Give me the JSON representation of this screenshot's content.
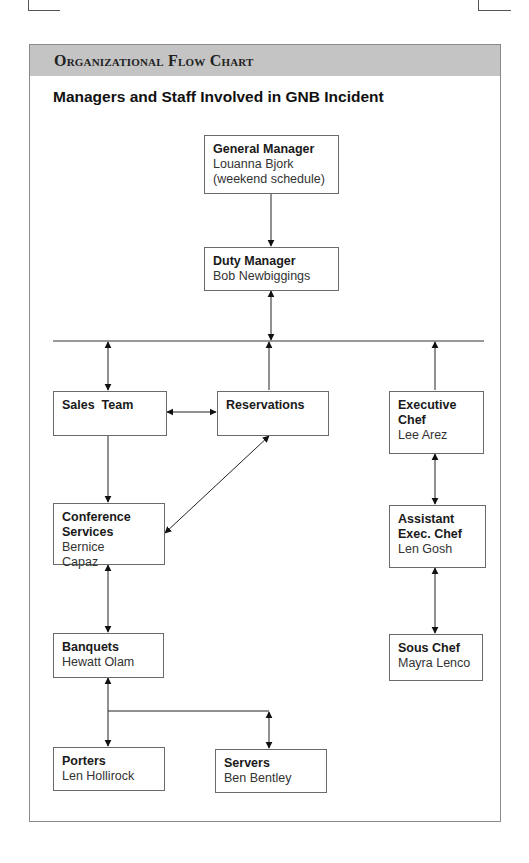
{
  "header": {
    "title": "Organizational Flow Chart",
    "subtitle": "Managers and Staff Involved in GNB Incident"
  },
  "nodes": [
    {
      "id": "general-manager",
      "role": "General Manager",
      "person": "Louanna Bjork",
      "note": "(weekend schedule)"
    },
    {
      "id": "duty-manager",
      "role": "Duty Manager",
      "person": "Bob Newbiggings"
    },
    {
      "id": "sales-team",
      "role": "Sales  Team",
      "person": ""
    },
    {
      "id": "reservations",
      "role": "Reservations",
      "person": ""
    },
    {
      "id": "executive-chef",
      "role": "Executive Chef",
      "person": "Lee Arez"
    },
    {
      "id": "conference-services",
      "role": "Conference Services",
      "person": "Bernice Capaz"
    },
    {
      "id": "assistant-exec-chef",
      "role": "Assistant Exec. Chef",
      "person": "Len Gosh"
    },
    {
      "id": "banquets",
      "role": "Banquets",
      "person": "Hewatt Olam"
    },
    {
      "id": "sous-chef",
      "role": "Sous Chef",
      "person": "Mayra Lenco"
    },
    {
      "id": "porters",
      "role": "Porters",
      "person": "Len Hollirock"
    },
    {
      "id": "servers",
      "role": "Servers",
      "person": "Ben Bentley"
    }
  ],
  "edges": [
    {
      "from": "General Manager",
      "to": "Duty Manager",
      "type": "one-way"
    },
    {
      "from": "Duty Manager",
      "to": "Horizontal bus",
      "type": "two-way"
    },
    {
      "from": "Horizontal bus",
      "to": "Sales Team",
      "type": "two-way"
    },
    {
      "from": "Reservations",
      "to": "Horizontal bus",
      "type": "one-way"
    },
    {
      "from": "Executive Chef",
      "to": "Horizontal bus",
      "type": "one-way"
    },
    {
      "from": "Sales Team",
      "to": "Reservations",
      "type": "two-way"
    },
    {
      "from": "Sales Team",
      "to": "Conference Services",
      "type": "one-way"
    },
    {
      "from": "Reservations",
      "to": "Conference Services",
      "type": "two-way"
    },
    {
      "from": "Executive Chef",
      "to": "Assistant Exec. Chef",
      "type": "two-way"
    },
    {
      "from": "Conference Services",
      "to": "Banquets",
      "type": "two-way"
    },
    {
      "from": "Assistant Exec. Chef",
      "to": "Sous Chef",
      "type": "two-way"
    },
    {
      "from": "Banquets",
      "to": "Porters",
      "type": "two-way"
    },
    {
      "from": "Banquets",
      "to": "Servers",
      "type": "two-way"
    }
  ]
}
